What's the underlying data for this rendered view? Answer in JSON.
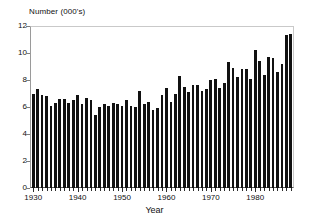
{
  "chart_data": {
    "type": "bar",
    "title": "",
    "ylabel": "Number (000's)",
    "xlabel": "Year",
    "ylim": [
      0,
      12
    ],
    "y_ticks": [
      0,
      2,
      4,
      6,
      8,
      10,
      12
    ],
    "y_tick_labels": [
      "0",
      "2",
      "4",
      "6",
      "8",
      "10",
      "12"
    ],
    "xlim": [
      1929.5,
      1988.5
    ],
    "x_tick_labels": [
      "1930",
      "1940",
      "1950",
      "1960",
      "1970",
      "1980"
    ],
    "x_tick_values": [
      1930,
      1940,
      1950,
      1960,
      1970,
      1980
    ],
    "x_minor_tick_interval": 1,
    "grid": false,
    "legend": null,
    "bar_color": "#111111",
    "categories": [
      1930,
      1931,
      1932,
      1933,
      1934,
      1935,
      1936,
      1937,
      1938,
      1939,
      1940,
      1941,
      1942,
      1943,
      1944,
      1945,
      1946,
      1947,
      1948,
      1949,
      1950,
      1951,
      1952,
      1953,
      1954,
      1955,
      1956,
      1957,
      1958,
      1959,
      1960,
      1961,
      1962,
      1963,
      1964,
      1965,
      1966,
      1967,
      1968,
      1969,
      1970,
      1971,
      1972,
      1973,
      1974,
      1975,
      1976,
      1977,
      1978,
      1979,
      1980,
      1981,
      1982,
      1983,
      1984,
      1985,
      1986,
      1987,
      1988
    ],
    "values": [
      7.0,
      7.3,
      6.9,
      6.8,
      6.1,
      6.3,
      6.6,
      6.6,
      6.3,
      6.5,
      6.9,
      6.2,
      6.7,
      6.5,
      5.4,
      6.0,
      6.2,
      6.1,
      6.3,
      6.2,
      6.1,
      6.5,
      6.1,
      6.0,
      7.2,
      6.2,
      6.4,
      5.8,
      5.9,
      6.9,
      7.4,
      6.4,
      7.0,
      8.3,
      7.5,
      7.1,
      7.6,
      7.6,
      7.2,
      7.3,
      8.0,
      8.1,
      7.4,
      7.8,
      9.3,
      8.9,
      8.2,
      8.8,
      8.8,
      8.1,
      10.2,
      9.4,
      8.4,
      9.7,
      9.6,
      8.6,
      9.2,
      11.3,
      11.4
    ]
  },
  "axis": {
    "y_title": "Number (000's)",
    "x_title": "Year"
  }
}
